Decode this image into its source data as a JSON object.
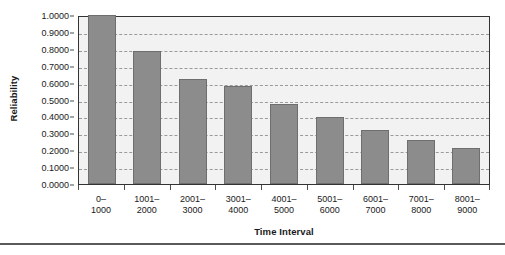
{
  "chart_data": {
    "type": "bar",
    "title": "",
    "xlabel": "Time Interval",
    "ylabel": "Reliability",
    "categories": [
      "0–\n1000",
      "1001–\n2000",
      "2001–\n3000",
      "3001–\n4000",
      "4001–\n5000",
      "5001–\n6000",
      "6001–\n7000",
      "7001–\n8000",
      "8001–\n9000"
    ],
    "category_lines": [
      {
        "line1": "0–",
        "line2": "1000"
      },
      {
        "line1": "1001–",
        "line2": "2000"
      },
      {
        "line1": "2001–",
        "line2": "3000"
      },
      {
        "line1": "3001–",
        "line2": "4000"
      },
      {
        "line1": "4001–",
        "line2": "5000"
      },
      {
        "line1": "5001–",
        "line2": "6000"
      },
      {
        "line1": "6001–",
        "line2": "7000"
      },
      {
        "line1": "7001–",
        "line2": "8000"
      },
      {
        "line1": "8001–",
        "line2": "9000"
      }
    ],
    "values": [
      1.0,
      0.79,
      0.62,
      0.58,
      0.475,
      0.395,
      0.32,
      0.26,
      0.215
    ],
    "ylim": [
      0.0,
      1.0
    ],
    "ytick_values": [
      1.0,
      0.9,
      0.8,
      0.7,
      0.6,
      0.5,
      0.4,
      0.3,
      0.2,
      0.1,
      0.0
    ],
    "ytick_labels": [
      "1.0000",
      "0.9000",
      "0.8000",
      "0.7000",
      "0.6000",
      "0.5000",
      "0.4000",
      "0.3000",
      "0.2000",
      "0.1000",
      "0.0000"
    ],
    "grid": true,
    "grid_style": "dashed",
    "legend": false,
    "legend_position": "none",
    "colors": {
      "bar_fill": "#8c8c8c",
      "bar_border": "#6e6e6e",
      "plot_background": "#f2f2f2",
      "gridline": "#9a9a9a",
      "axis": "#333333",
      "text": "#1a1a1a",
      "rule": "#5a5a5a"
    }
  }
}
